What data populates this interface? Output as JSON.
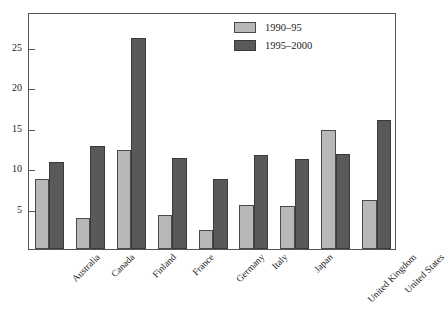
{
  "chart_data": {
    "type": "bar",
    "title": "",
    "subtitle": "",
    "xlabel": "",
    "ylabel": "",
    "categories": [
      "Australia",
      "Canada",
      "Finland",
      "France",
      "Germany",
      "Italy",
      "Japan",
      "United Kingdom",
      "United States"
    ],
    "series": [
      {
        "name": "1990–95",
        "color": "#b8b8b8",
        "values": [
          8.7,
          3.8,
          12.2,
          4.2,
          2.3,
          5.4,
          5.3,
          14.7,
          6.0
        ]
      },
      {
        "name": "1995–2000",
        "color": "#595959",
        "values": [
          10.7,
          12.7,
          26.1,
          11.3,
          8.6,
          11.6,
          11.1,
          11.7,
          15.9
        ]
      }
    ],
    "ylim": [
      0,
      29.3
    ],
    "yticks": [
      5,
      10,
      15,
      20,
      25
    ],
    "ytick_labels": [
      "5",
      "10",
      "15",
      "20",
      "25"
    ],
    "grid": false,
    "legend_position": "top-right",
    "xtick_rotation": -45
  }
}
